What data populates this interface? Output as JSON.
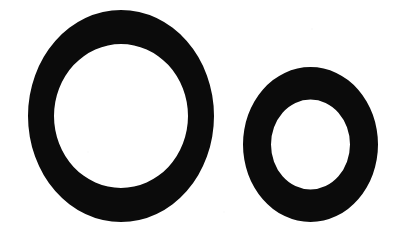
{
  "page": {
    "kind": "letterform-specimen",
    "title": "Oo",
    "background_color": "#ffffff",
    "ink_color": "#0b0b0b",
    "width": 400,
    "height": 241
  },
  "glyphs": [
    {
      "id": "uppercase-o",
      "character": "O",
      "case": "uppercase",
      "name": "Latin Capital Letter O",
      "outer": {
        "cx": 121,
        "cy": 116,
        "rx": 93,
        "ry": 106
      },
      "inner": {
        "cx": 121,
        "cy": 116,
        "rx": 67,
        "ry": 72
      },
      "stroke_horizontal_px": 26,
      "stroke_vertical_px": 34,
      "bounds": {
        "left": 28,
        "top": 10,
        "right": 214,
        "bottom": 222
      }
    },
    {
      "id": "lowercase-o",
      "character": "o",
      "case": "lowercase",
      "name": "Latin Small Letter O",
      "outer": {
        "cx": 310.5,
        "cy": 144.5,
        "rx": 67.5,
        "ry": 77.5
      },
      "inner": {
        "cx": 310.5,
        "cy": 144.5,
        "rx": 39.5,
        "ry": 45
      },
      "stroke_horizontal_px": 28,
      "stroke_vertical_px": 33,
      "bounds": {
        "left": 243,
        "top": 67,
        "right": 378,
        "bottom": 222
      }
    }
  ]
}
